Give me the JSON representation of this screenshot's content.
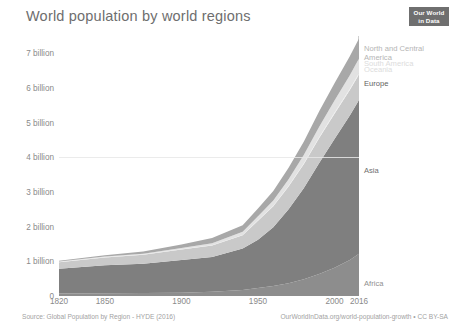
{
  "header": {
    "title": "World population by world regions",
    "logo_line1": "Our World",
    "logo_line2": "in Data"
  },
  "footer": {
    "source": "Source: Global Population by Region - HYDE (2016)",
    "attribution": "OurWorldInData.org/world-population-growth • CC BY-SA"
  },
  "axes": {
    "y_ticks": [
      "7 billion",
      "6 billion",
      "5 billion",
      "4 billion",
      "3 billion",
      "2 billion",
      "1 billion",
      "0"
    ],
    "x_ticks": [
      "1820",
      "1850",
      "1900",
      "1950",
      "2000",
      "2016"
    ]
  },
  "chart_data": {
    "type": "area",
    "title": "World population by world regions",
    "xlabel": "",
    "ylabel": "",
    "xlim": [
      1820,
      2016
    ],
    "ylim": [
      0,
      7.5
    ],
    "grid": false,
    "legend_position": "right-inline",
    "stacked": true,
    "y_unit": "billion people",
    "x": [
      1820,
      1850,
      1875,
      1900,
      1920,
      1940,
      1950,
      1960,
      1970,
      1980,
      1990,
      2000,
      2010,
      2016
    ],
    "series": [
      {
        "name": "Africa",
        "color": "#8d8d8d",
        "label_y_billion": 0.35,
        "values": [
          0.074,
          0.081,
          0.086,
          0.092,
          0.125,
          0.172,
          0.228,
          0.285,
          0.366,
          0.481,
          0.638,
          0.818,
          1.039,
          1.216
        ]
      },
      {
        "name": "Asia",
        "color": "#7f7f7f",
        "label_y_billion": 3.6,
        "values": [
          0.71,
          0.809,
          0.846,
          0.947,
          1.0,
          1.199,
          1.394,
          1.7,
          2.135,
          2.632,
          3.202,
          3.714,
          4.165,
          4.436
        ]
      },
      {
        "name": "Europe",
        "color": "#c9c9c9",
        "label_y_billion": 6.12,
        "values": [
          0.192,
          0.223,
          0.26,
          0.3,
          0.33,
          0.38,
          0.549,
          0.605,
          0.657,
          0.694,
          0.721,
          0.727,
          0.736,
          0.741
        ]
      },
      {
        "name": "Oceania",
        "color": "#ededed",
        "label_y_billion": 6.52,
        "values": [
          0.002,
          0.002,
          0.002,
          0.006,
          0.009,
          0.011,
          0.013,
          0.016,
          0.02,
          0.023,
          0.027,
          0.031,
          0.037,
          0.04
        ]
      },
      {
        "name": "South America",
        "color": "#e2e2e2",
        "label_y_billion": 6.68,
        "values": [
          0.017,
          0.022,
          0.027,
          0.038,
          0.061,
          0.09,
          0.114,
          0.148,
          0.192,
          0.241,
          0.297,
          0.348,
          0.394,
          0.419
        ]
      },
      {
        "name": "North and Central America",
        "color": "#a8a8a8",
        "label_y_billion": 7.12,
        "values": [
          0.025,
          0.039,
          0.06,
          0.106,
          0.146,
          0.186,
          0.227,
          0.277,
          0.333,
          0.388,
          0.444,
          0.497,
          0.545,
          0.576
        ]
      }
    ],
    "series_label_display": {
      "africa": "Africa",
      "asia": "Asia",
      "europe": "Europe",
      "oceania": "Oceania",
      "south_america": "South America",
      "north_central_america": "North and Central\nAmerica"
    },
    "totals": {
      "1820": 1.02,
      "1900": 1.49,
      "1950": 2.52,
      "2000": 6.14,
      "2016": 7.43
    }
  }
}
